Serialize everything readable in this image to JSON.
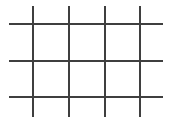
{
  "canvas": {
    "width": 172,
    "height": 123,
    "background_color": "#ffffff",
    "title": "Grid Line Drawing"
  },
  "drawing": {
    "name": "orthogonal-grid",
    "description": "Hand-drawn style grid of four vertical and three horizontal straight lines forming a lattice of rectangular cells",
    "stroke_color": "#3f3f3f",
    "stroke_width": 2,
    "vertical_lines": [
      {
        "name": "vertical-line-1",
        "x": 33,
        "y1": 6,
        "y2": 117
      },
      {
        "name": "vertical-line-2",
        "x": 69,
        "y1": 6,
        "y2": 117
      },
      {
        "name": "vertical-line-3",
        "x": 105,
        "y1": 6,
        "y2": 117
      },
      {
        "name": "vertical-line-4",
        "x": 140,
        "y1": 6,
        "y2": 117
      }
    ],
    "horizontal_lines": [
      {
        "name": "horizontal-line-1",
        "y": 24,
        "x1": 9,
        "x2": 163
      },
      {
        "name": "horizontal-line-2",
        "y": 61,
        "x1": 9,
        "x2": 163
      },
      {
        "name": "horizontal-line-3",
        "y": 97,
        "x1": 9,
        "x2": 163
      }
    ],
    "counts": {
      "vertical": 4,
      "horizontal": 3,
      "intersections": 12
    }
  }
}
